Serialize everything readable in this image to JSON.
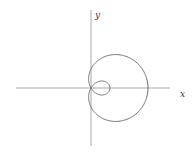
{
  "diagram": {
    "type": "polar-curve",
    "equation": "r = a + b cos θ (b > a)",
    "axes": {
      "x_label": "x",
      "y_label": "y"
    },
    "colors": {
      "axis": "#9a9a9a",
      "curve": "#6e6e6e",
      "background": "#ffffff"
    },
    "geometry": {
      "origin_px": [
        91,
        88
      ],
      "a_px": 19,
      "b_px": 38
    }
  }
}
